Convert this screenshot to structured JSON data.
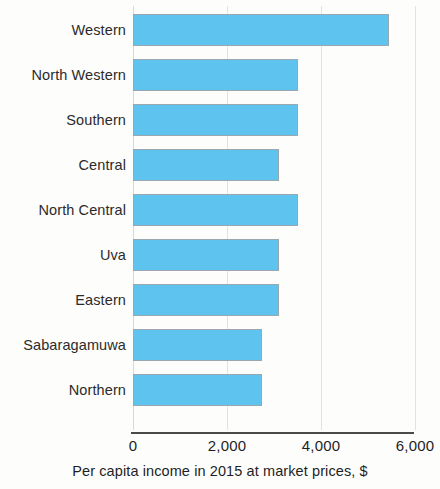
{
  "chart_data": {
    "type": "bar",
    "orientation": "horizontal",
    "title": "",
    "subtitle": "",
    "xlabel": "Per capita income in 2015 at market prices, $",
    "ylabel": "",
    "categories": [
      "Western",
      "North Western",
      "Southern",
      "Central",
      "North Central",
      "Uva",
      "Eastern",
      "Sabaragamuwa",
      "Northern"
    ],
    "values": [
      5450,
      3500,
      3500,
      3100,
      3500,
      3100,
      3100,
      2750,
      2750
    ],
    "series": [
      {
        "name": "Per capita income",
        "values": [
          5450,
          3500,
          3500,
          3100,
          3500,
          3100,
          3100,
          2750,
          2750
        ]
      }
    ],
    "xlim": [
      0,
      6000
    ],
    "xticks": [
      0,
      2000,
      4000,
      6000
    ],
    "xtick_labels": [
      "0",
      "2,000",
      "4,000",
      "6,000"
    ],
    "grid": true,
    "grid_axis": "x",
    "legend": false,
    "legend_position": "none",
    "bar_color": "#5fc3ef",
    "bar_border_color": "#9aa7ae",
    "grid_color": "#e2e2e2",
    "axis_color": "#4a4a4a",
    "text_color": "#1f1f1f",
    "background_color": "#fdfdfc"
  }
}
